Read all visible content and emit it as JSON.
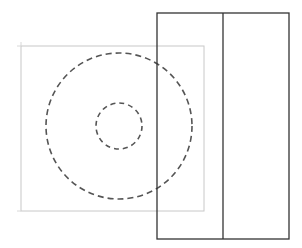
{
  "canvas": {
    "width": 302,
    "height": 248,
    "background": "#ffffff"
  },
  "shapes": {
    "bounding_square": {
      "x": 21,
      "y": 46,
      "width": 183,
      "height": 165,
      "stroke": "#c8c8c8",
      "stroke_width": 1
    },
    "outer_circle": {
      "cx": 119,
      "cy": 126,
      "r": 73,
      "stroke": "#555555",
      "stroke_width": 1.6,
      "dash": "6,4"
    },
    "inner_circle": {
      "cx": 119,
      "cy": 126,
      "r": 23,
      "stroke": "#555555",
      "stroke_width": 1.6,
      "dash": "5,4"
    },
    "panel_rect": {
      "x": 157,
      "y": 13,
      "width": 132,
      "height": 226,
      "stroke": "#333333",
      "stroke_width": 1.3
    },
    "panel_divider": {
      "x": 223,
      "y1": 13,
      "y2": 239,
      "stroke": "#333333",
      "stroke_width": 1.3
    }
  }
}
